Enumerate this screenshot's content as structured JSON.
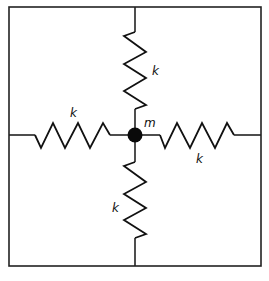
{
  "diagram": {
    "mass": {
      "label": "m",
      "color": "#0a0a0a"
    },
    "springs": [
      {
        "id": "top",
        "label": "k"
      },
      {
        "id": "left",
        "label": "k"
      },
      {
        "id": "right",
        "label": "k"
      },
      {
        "id": "bottom",
        "label": "k"
      }
    ],
    "frame": {
      "shape": "square",
      "color": "#222222"
    }
  }
}
